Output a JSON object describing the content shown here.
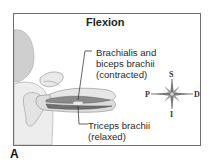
{
  "diagram": {
    "title": "Flexion",
    "labels": {
      "contracted_line1": "Brachialis and",
      "contracted_line2": "biceps brachii",
      "contracted_line3": "(contracted)",
      "relaxed_line1": "Triceps brachii",
      "relaxed_line2": "(relaxed)"
    },
    "compass": {
      "north": "S",
      "south": "I",
      "west": "P",
      "east": "D"
    },
    "panel_label": "A",
    "colors": {
      "frame": "#6e6e6e",
      "skin": "#e9e9e9",
      "skin_shade": "#cfcfcf",
      "muscle": "#7a7a7a",
      "text": "#2a2a2a"
    }
  }
}
